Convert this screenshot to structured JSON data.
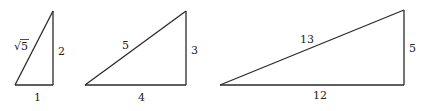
{
  "diagram": {
    "triangles": [
      {
        "name": "triangle-1-2-sqrt5",
        "legs": {
          "base": "1",
          "height": "2"
        },
        "hypotenuse": "√5",
        "hypotenuse_parts": {
          "radical": "√",
          "radicand": "5"
        }
      },
      {
        "name": "triangle-3-4-5",
        "legs": {
          "base": "4",
          "height": "3"
        },
        "hypotenuse": "5"
      },
      {
        "name": "triangle-5-12-13",
        "legs": {
          "base": "12",
          "height": "5"
        },
        "hypotenuse": "13"
      }
    ]
  }
}
